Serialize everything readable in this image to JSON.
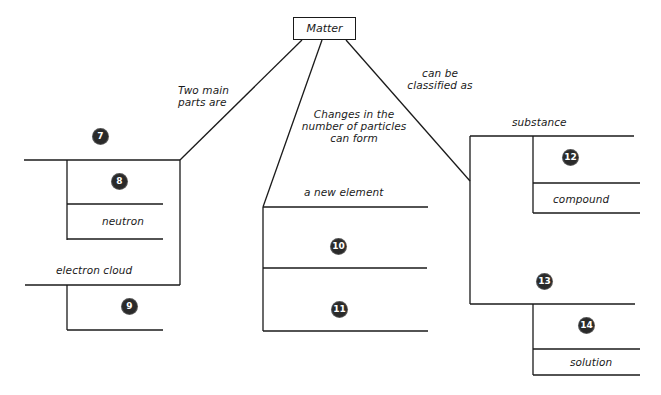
{
  "root": {
    "label": "Matter"
  },
  "links": {
    "left": "Two main parts are",
    "left_lines": [
      "Two main",
      "parts are"
    ],
    "middle_lines": [
      "Changes in the",
      "number of particles",
      "can form"
    ],
    "right_lines": [
      "can be",
      "classified as"
    ]
  },
  "left_branch": {
    "blank_top": {
      "number": "7"
    },
    "sub_items": [
      {
        "number": "8"
      },
      {
        "label": "neutron"
      }
    ],
    "second": {
      "label": "electron cloud"
    },
    "second_sub": [
      {
        "number": "9"
      }
    ]
  },
  "middle_branch": {
    "header": {
      "label": "a new element"
    },
    "items": [
      {
        "number": "10"
      },
      {
        "number": "11"
      }
    ]
  },
  "right_branch": {
    "header": {
      "label": "substance"
    },
    "sub_items": [
      {
        "number": "12"
      },
      {
        "label": "compound"
      }
    ],
    "second": {
      "number": "13"
    },
    "second_sub": [
      {
        "number": "14"
      },
      {
        "label": "solution"
      }
    ]
  }
}
